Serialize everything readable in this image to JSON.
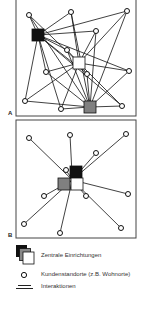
{
  "panels": [
    {
      "label": "A",
      "frame": {
        "x": 16,
        "y": -2,
        "w": 120,
        "h": 118
      },
      "hubs": [
        {
          "id": "black",
          "x": 38,
          "y": 35,
          "color": "#111111"
        },
        {
          "id": "white",
          "x": 79,
          "y": 63,
          "color": "#ffffff"
        },
        {
          "id": "gray",
          "x": 90,
          "y": 107,
          "color": "#808080"
        }
      ],
      "nodes": [
        {
          "x": 29,
          "y": 15
        },
        {
          "x": 71,
          "y": 12
        },
        {
          "x": 127,
          "y": 11
        },
        {
          "x": 96,
          "y": 31
        },
        {
          "x": 67,
          "y": 50
        },
        {
          "x": 46,
          "y": 72
        },
        {
          "x": 129,
          "y": 71
        },
        {
          "x": 87,
          "y": 74
        },
        {
          "x": 25,
          "y": 101
        },
        {
          "x": 61,
          "y": 109
        },
        {
          "x": 122,
          "y": 106
        }
      ],
      "mode": "all-to-all"
    },
    {
      "label": "B",
      "frame": {
        "x": 16,
        "y": 120,
        "w": 120,
        "h": 118
      },
      "hubs": [
        {
          "id": "black",
          "x": 76,
          "y": 172,
          "color": "#111111"
        },
        {
          "id": "gray",
          "x": 64,
          "y": 184,
          "color": "#808080"
        },
        {
          "id": "white",
          "x": 77,
          "y": 184,
          "color": "#ffffff"
        }
      ],
      "nodes": [
        {
          "x": 29,
          "y": 138
        },
        {
          "x": 70,
          "y": 135
        },
        {
          "x": 126,
          "y": 134
        },
        {
          "x": 96,
          "y": 153
        },
        {
          "x": 66,
          "y": 170
        },
        {
          "x": 44,
          "y": 196
        },
        {
          "x": 128,
          "y": 194
        },
        {
          "x": 86,
          "y": 196
        },
        {
          "x": 24,
          "y": 224
        },
        {
          "x": 60,
          "y": 233
        },
        {
          "x": 121,
          "y": 228
        }
      ],
      "mode": "radial"
    }
  ],
  "legend": {
    "items": [
      {
        "icon": "stacked-squares-icon",
        "label": "Zentrale Einrichtungen"
      },
      {
        "icon": "circle-icon",
        "label": "Kundenstandorte (z.B. Wohnorte)"
      },
      {
        "icon": "double-line-icon",
        "label": "Interaktionen"
      }
    ]
  }
}
